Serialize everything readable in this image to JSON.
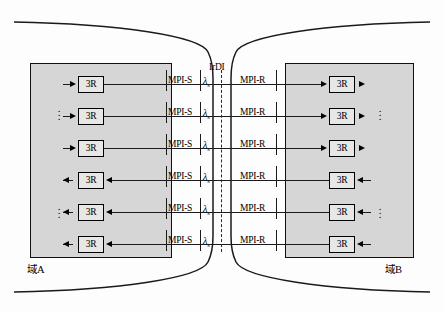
{
  "diagram": {
    "title_labels": {
      "irdi": "IrDI",
      "domain_a": "域A",
      "domain_b": "域B"
    },
    "colors": {
      "panel_fill": "#d6d6d6",
      "box_fill": "#e7e7e7",
      "line": "#1a1a1a",
      "dashed_boundary": "#2a2a2a"
    },
    "regenerator_label": "3R",
    "reference_points": {
      "source": "MPI-S",
      "receive": "MPI-R"
    },
    "wavelength_label": "λ",
    "wavelength_subscript": "s",
    "rows": [
      {
        "index": 1,
        "direction": "left-to-right",
        "left_box": "3R",
        "right_box": "3R",
        "source_ref": "MPI-S",
        "receive_ref": "MPI-R",
        "wavelength": "λs"
      },
      {
        "index": 2,
        "direction": "left-to-right",
        "left_box": "3R",
        "right_box": "3R",
        "source_ref": "MPI-S",
        "receive_ref": "MPI-R",
        "wavelength": "λs"
      },
      {
        "index": 3,
        "direction": "left-to-right",
        "left_box": "3R",
        "right_box": "3R",
        "source_ref": "MPI-S",
        "receive_ref": "MPI-R",
        "wavelength": "λs"
      },
      {
        "index": 4,
        "direction": "right-to-left",
        "left_box": "3R",
        "right_box": "3R",
        "source_ref": "MPI-S",
        "receive_ref": "MPI-R",
        "wavelength": "λs"
      },
      {
        "index": 5,
        "direction": "right-to-left",
        "left_box": "3R",
        "right_box": "3R",
        "source_ref": "MPI-S",
        "receive_ref": "MPI-R",
        "wavelength": "λs"
      },
      {
        "index": 6,
        "direction": "right-to-left",
        "left_box": "3R",
        "right_box": "3R",
        "source_ref": "MPI-S",
        "receive_ref": "MPI-R",
        "wavelength": "λs"
      }
    ],
    "ellipsis": "⋮"
  }
}
